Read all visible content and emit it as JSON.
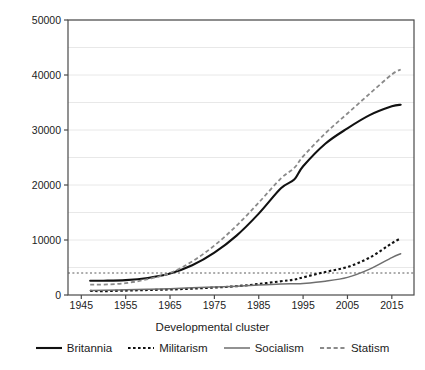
{
  "chart_data": {
    "type": "line",
    "title": "",
    "xlabel": "Developmental cluster",
    "ylabel": "GDP per capita (USD)",
    "xlim": [
      1942,
      2020
    ],
    "ylim": [
      0,
      50000
    ],
    "xticks": [
      1945,
      1955,
      1965,
      1975,
      1985,
      1995,
      2005,
      2015
    ],
    "yticks": [
      0,
      10000,
      20000,
      30000,
      40000,
      50000
    ],
    "gridlines_y": [
      5000,
      10000,
      15000,
      20000,
      25000,
      30000,
      35000,
      40000,
      45000,
      50000
    ],
    "grid": true,
    "legend_position": "bottom",
    "reference_line": {
      "y": 4000,
      "style": "dotted",
      "color": "#5a5a5a"
    },
    "x": [
      1947,
      1950,
      1955,
      1960,
      1965,
      1970,
      1975,
      1980,
      1985,
      1990,
      1993,
      1995,
      2000,
      2005,
      2010,
      2015,
      2017
    ],
    "series": [
      {
        "name": "Britannia",
        "style": "solid",
        "color": "#111111",
        "width": 2.1,
        "values": [
          2600,
          2600,
          2700,
          3100,
          3900,
          5400,
          7700,
          10800,
          14800,
          19400,
          21000,
          23400,
          27500,
          30300,
          32700,
          34300,
          34600
        ]
      },
      {
        "name": "Militarism",
        "style": "dotted",
        "color": "#111111",
        "width": 2.1,
        "values": [
          750,
          700,
          800,
          900,
          1000,
          1150,
          1350,
          1600,
          2000,
          2500,
          2800,
          3200,
          4200,
          5100,
          6800,
          9400,
          10300
        ]
      },
      {
        "name": "Socialism",
        "style": "solid",
        "color": "#6e6e6e",
        "width": 1.5,
        "values": [
          800,
          850,
          950,
          1050,
          1150,
          1300,
          1450,
          1600,
          1800,
          2000,
          2050,
          2100,
          2500,
          3200,
          4700,
          6800,
          7500
        ]
      },
      {
        "name": "Statism",
        "style": "dashed",
        "color": "#8a8a8a",
        "width": 1.8,
        "values": [
          1900,
          1900,
          2150,
          2900,
          4000,
          6100,
          9000,
          12600,
          16800,
          21200,
          23100,
          25200,
          29400,
          33000,
          36600,
          40100,
          41000
        ]
      }
    ]
  },
  "axis": {
    "y_title": "GDP per capita (USD)",
    "x_title": "Developmental cluster",
    "y_tick_labels": [
      "0",
      "10000",
      "20000",
      "30000",
      "40000",
      "50000"
    ],
    "x_tick_labels": [
      "1945",
      "1955",
      "1965",
      "1975",
      "1985",
      "1995",
      "2005",
      "2015"
    ]
  },
  "legend": {
    "items": [
      {
        "label": "Britannia",
        "style": "solid",
        "color": "#111111"
      },
      {
        "label": "Militarism",
        "style": "dotted",
        "color": "#111111"
      },
      {
        "label": "Socialism",
        "style": "solid",
        "color": "#6e6e6e"
      },
      {
        "label": "Statism",
        "style": "dashed",
        "color": "#8a8a8a"
      }
    ]
  },
  "colors": {
    "background": "#ffffff",
    "axis": "#4a4a4a",
    "grid": "#e8e8e8",
    "text": "#1c1c1c"
  }
}
